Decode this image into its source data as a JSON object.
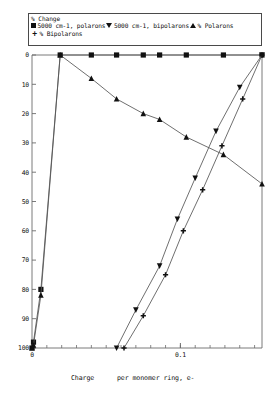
{
  "legend": {
    "title": "% Change",
    "entries": [
      {
        "marker": "filled-square-icon",
        "label": "5000 cm-1, polarons"
      },
      {
        "marker": "filled-triangle-down-icon",
        "label": "5000 cm-1, bipolarons"
      },
      {
        "marker": "filled-triangle-up-icon",
        "label": "% Polarons"
      },
      {
        "marker": "plus-icon",
        "label": "% Bipolarons"
      }
    ]
  },
  "axis": {
    "x_title_left": "Charge",
    "x_title_right": "per monomer ring, e-",
    "x_ticklabels": [
      "0",
      "0.1"
    ],
    "y_ticklabels": [
      "100",
      "90",
      "80",
      "70",
      "60",
      "50",
      "40",
      "30",
      "20",
      "10",
      "0"
    ]
  },
  "chart_data": {
    "type": "line",
    "title": "% Change",
    "xlabel": "Charge    per monomer ring, e-",
    "ylabel": "% Change",
    "xlim": [
      0,
      0.155
    ],
    "ylim": [
      0,
      100
    ],
    "yticks": [
      0,
      10,
      20,
      30,
      40,
      50,
      60,
      70,
      80,
      90,
      100
    ],
    "xticks": [
      0,
      0.1
    ],
    "grid": false,
    "legend_position": "top",
    "series": [
      {
        "name": "5000 cm-1, polarons",
        "marker": "filled-square",
        "x": [
          0.0,
          0.001,
          0.006,
          0.019,
          0.04,
          0.057,
          0.075,
          0.086,
          0.104,
          0.129,
          0.155
        ],
        "y": [
          0.0,
          2.0,
          20.0,
          100.0,
          100.0,
          100.0,
          100.0,
          100.0,
          100.0,
          100.0,
          100.0
        ]
      },
      {
        "name": "% Polarons",
        "marker": "filled-triangle-up",
        "x": [
          0.0,
          0.001,
          0.006,
          0.019,
          0.04,
          0.057,
          0.075,
          0.086,
          0.104,
          0.129,
          0.155
        ],
        "y": [
          0.0,
          1.0,
          18.0,
          100.0,
          92.0,
          85.0,
          80.0,
          78.0,
          72.0,
          66.0,
          56.0
        ]
      },
      {
        "name": "5000 cm-1, bipolarons",
        "marker": "filled-triangle-down",
        "x": [
          0.057,
          0.07,
          0.086,
          0.098,
          0.11,
          0.124,
          0.14,
          0.155
        ],
        "y": [
          0.0,
          13.0,
          28.0,
          44.0,
          58.0,
          74.0,
          89.0,
          100.0
        ]
      },
      {
        "name": "% Bipolarons",
        "marker": "plus",
        "x": [
          0.062,
          0.075,
          0.09,
          0.102,
          0.115,
          0.128,
          0.142,
          0.155
        ],
        "y": [
          0.0,
          11.0,
          25.0,
          40.0,
          54.0,
          69.0,
          85.0,
          100.0
        ]
      }
    ]
  },
  "style": {
    "line_color": "#555555",
    "marker_color": "#111111",
    "frame_color": "#6b6b6b",
    "background": "#ffffff"
  }
}
